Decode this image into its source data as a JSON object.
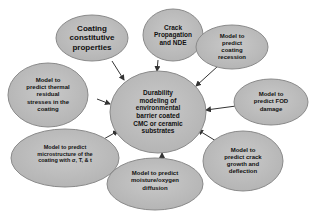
{
  "diagram": {
    "colors": {
      "fill": "#bdbdbd",
      "stroke": "#8a8a8a",
      "arrow": "#333333",
      "text": "#111111"
    },
    "center": {
      "label": "Durability\nmodeling of\nenvironmental\nbarrier coated\nCMC or ceramic\nsubstrates"
    },
    "nodes": [
      {
        "id": "coating-constitutive",
        "label": "Coating\nconstitutive\nproperties"
      },
      {
        "id": "crack-propagation",
        "label": "Crack\nPropagation\nand NDE"
      },
      {
        "id": "coating-recession",
        "label": "Model to\npredict\ncoating\nrecession"
      },
      {
        "id": "thermal-residual",
        "label": "Model to\npredict thermal\nresidual\nstresses in the\ncoating"
      },
      {
        "id": "fod-damage",
        "label": "Model to\npredict FOD\ndamage"
      },
      {
        "id": "microstructure",
        "label": "Model  to predict\nmicrostructure of the\ncoating with σ, T, & t"
      },
      {
        "id": "moisture-diffusion",
        "label": "Model to predict\nmoisture/oxygen\ndiffusion"
      },
      {
        "id": "crack-growth",
        "label": "Model to\npredict crack\ngrowth and\ndeflection"
      }
    ]
  }
}
